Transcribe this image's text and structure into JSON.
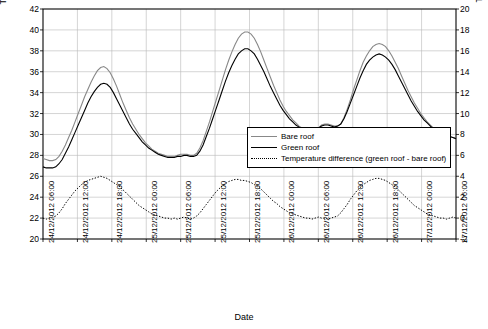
{
  "chart_data": {
    "type": "line",
    "title": "",
    "xlabel": "Date",
    "ylabel": "Temperature (°C)",
    "y2label": "Temperature difference (°C)",
    "ylim": [
      20,
      42
    ],
    "yticks": [
      20,
      22,
      24,
      26,
      28,
      30,
      32,
      34,
      36,
      38,
      40,
      42
    ],
    "y2lim": [
      -2,
      20
    ],
    "y2ticks": [
      -2,
      0,
      2,
      4,
      6,
      8,
      10,
      12,
      14,
      16,
      18,
      20
    ],
    "xticks": [
      "24/12/2012 06:00",
      "24/12/2012 12:00",
      "24/12/2012 18:00",
      "25/12/2012 00:00",
      "25/12/2012 06:00",
      "25/12/2012 12:00",
      "25/12/2012 18:00",
      "26/12/2012 00:00",
      "26/12/2012 06:00",
      "26/12/2012 12:00",
      "26/12/2012 18:00",
      "27/12/2012 00:00",
      "27/12/2012 06:00"
    ],
    "grid": true,
    "legend_position": "center-right",
    "series": [
      {
        "name": "Bare roof",
        "axis": "left",
        "color": "#888888",
        "style": "solid",
        "values": [
          27.7,
          27.6,
          27.5,
          27.5,
          27.6,
          27.9,
          28.4,
          29.0,
          29.7,
          30.4,
          31.2,
          32.0,
          32.8,
          33.6,
          34.3,
          35.0,
          35.6,
          36.1,
          36.4,
          36.5,
          36.3,
          35.9,
          35.3,
          34.6,
          33.8,
          33.0,
          32.3,
          31.6,
          31.0,
          30.5,
          30.0,
          29.6,
          29.2,
          28.9,
          28.6,
          28.4,
          28.2,
          28.1,
          28.0,
          27.9,
          27.9,
          27.9,
          28.0,
          28.1,
          28.1,
          28.1,
          28.0,
          28.0,
          28.2,
          28.7,
          29.4,
          30.3,
          31.2,
          32.2,
          33.2,
          34.2,
          35.2,
          36.2,
          37.1,
          37.9,
          38.6,
          39.2,
          39.6,
          39.8,
          39.8,
          39.6,
          39.2,
          38.6,
          37.9,
          37.1,
          36.3,
          35.5,
          34.7,
          34.0,
          33.3,
          32.7,
          32.2,
          31.8,
          31.4,
          31.1,
          30.8,
          30.6,
          30.4,
          30.3,
          30.3,
          30.4,
          30.6,
          30.9,
          31.0,
          31.0,
          30.9,
          30.8,
          30.8,
          31.0,
          31.6,
          32.4,
          33.3,
          34.3,
          35.2,
          36.1,
          36.9,
          37.5,
          38.0,
          38.4,
          38.6,
          38.7,
          38.6,
          38.4,
          38.0,
          37.5,
          36.9,
          36.3,
          35.6,
          34.9,
          34.2,
          33.6,
          33.0,
          32.5,
          32.0,
          31.6,
          31.2,
          30.9,
          30.6,
          30.4,
          30.2,
          30.0,
          29.9,
          29.8,
          29.7,
          29.6
        ],
        "note": "Upper/lighter grey curve; peaks ~36.5 °C, ~39.8 °C, ~38.7 °C; minima ~27.5 °C, ~28.0 °C, ~30.3 °C"
      },
      {
        "name": "Green roof",
        "axis": "left",
        "color": "#000000",
        "style": "solid",
        "values": [
          26.9,
          26.8,
          26.8,
          26.8,
          26.9,
          27.2,
          27.6,
          28.2,
          28.8,
          29.5,
          30.2,
          30.9,
          31.6,
          32.3,
          33.0,
          33.6,
          34.1,
          34.5,
          34.8,
          34.9,
          34.8,
          34.5,
          34.0,
          33.4,
          32.8,
          32.2,
          31.6,
          31.0,
          30.5,
          30.1,
          29.7,
          29.3,
          29.0,
          28.7,
          28.5,
          28.3,
          28.1,
          28.0,
          27.9,
          27.8,
          27.8,
          27.8,
          27.9,
          27.9,
          28.0,
          28.0,
          27.9,
          27.9,
          28.0,
          28.4,
          29.0,
          29.8,
          30.6,
          31.5,
          32.4,
          33.3,
          34.2,
          35.1,
          35.9,
          36.6,
          37.2,
          37.7,
          38.0,
          38.2,
          38.2,
          38.0,
          37.7,
          37.2,
          36.6,
          36.0,
          35.3,
          34.6,
          34.0,
          33.4,
          32.8,
          32.3,
          31.9,
          31.5,
          31.2,
          30.9,
          30.7,
          30.5,
          30.4,
          30.3,
          30.3,
          30.4,
          30.6,
          30.8,
          30.9,
          30.9,
          30.8,
          30.7,
          30.8,
          31.0,
          31.5,
          32.2,
          33.0,
          33.8,
          34.6,
          35.4,
          36.1,
          36.7,
          37.1,
          37.4,
          37.6,
          37.7,
          37.6,
          37.4,
          37.1,
          36.7,
          36.2,
          35.6,
          35.0,
          34.4,
          33.8,
          33.2,
          32.7,
          32.2,
          31.8,
          31.4,
          31.1,
          30.8,
          30.5,
          30.3,
          30.1,
          30.0,
          29.9,
          29.8,
          29.7,
          29.6
        ],
        "note": "Lower/black curve; peaks ~34.9 °C, ~38.2 °C, ~37.7 °C"
      },
      {
        "name": "Temperature difference (green roof - bare roof)",
        "axis": "right",
        "color": "#000000",
        "style": "dotted",
        "values": [
          0.0,
          -0.1,
          0.0,
          0.1,
          0.2,
          0.5,
          0.9,
          1.4,
          1.8,
          2.2,
          2.6,
          2.9,
          3.2,
          3.4,
          3.6,
          3.7,
          3.8,
          3.9,
          4.0,
          3.9,
          3.8,
          3.6,
          3.4,
          3.2,
          3.0,
          2.7,
          2.4,
          2.1,
          1.8,
          1.5,
          1.2,
          1.0,
          0.8,
          0.6,
          0.4,
          0.3,
          0.2,
          0.1,
          0.0,
          0.0,
          -0.1,
          0.0,
          -0.1,
          0.0,
          0.1,
          0.0,
          -0.1,
          0.0,
          0.2,
          0.5,
          0.9,
          1.3,
          1.7,
          2.1,
          2.5,
          2.8,
          3.1,
          3.3,
          3.5,
          3.6,
          3.7,
          3.7,
          3.6,
          3.6,
          3.5,
          3.4,
          3.2,
          3.0,
          2.8,
          2.5,
          2.2,
          1.9,
          1.6,
          1.4,
          1.1,
          0.9,
          0.7,
          0.5,
          0.4,
          0.3,
          0.2,
          0.1,
          0.0,
          0.0,
          -0.1,
          0.0,
          0.1,
          0.0,
          0.0,
          -0.1,
          0.0,
          0.1,
          0.2,
          0.5,
          0.9,
          1.3,
          1.8,
          2.2,
          2.6,
          2.9,
          3.2,
          3.4,
          3.6,
          3.7,
          3.8,
          3.8,
          3.7,
          3.6,
          3.4,
          3.2,
          3.0,
          2.7,
          2.4,
          2.1,
          1.8,
          1.5,
          1.2,
          1.0,
          0.8,
          0.6,
          0.4,
          0.3,
          0.2,
          0.1,
          0.0,
          0.0,
          -0.1,
          0.0,
          0.1,
          0.0
        ],
        "note": "Dotted curve read on right axis; baseline near 0, three daytime peaks ~4 °C"
      }
    ],
    "legend": [
      {
        "label": "Bare roof",
        "style": "solid",
        "color": "#888888"
      },
      {
        "label": "Green roof",
        "style": "solid",
        "color": "#000000"
      },
      {
        "label": "Temperature difference (green roof - bare roof)",
        "style": "dotted",
        "color": "#000000"
      }
    ]
  }
}
